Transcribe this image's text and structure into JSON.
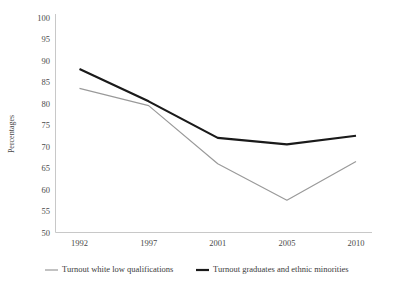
{
  "chart_data": {
    "type": "line",
    "title": "",
    "xlabel": "",
    "ylabel": "Percentages",
    "categories": [
      "1992",
      "1997",
      "2001",
      "2005",
      "2010"
    ],
    "ylim": [
      50,
      100
    ],
    "yticks": [
      50,
      55,
      60,
      65,
      70,
      75,
      80,
      85,
      90,
      95,
      100
    ],
    "grid": false,
    "legend_position": "bottom",
    "series": [
      {
        "name": "Turnout white low qualifications",
        "color": "#9a9a9a",
        "width": 1.2,
        "values": [
          83.5,
          79.5,
          66.0,
          57.5,
          66.5
        ]
      },
      {
        "name": "Turnout graduates and ethnic minorities",
        "color": "#1a1a1a",
        "width": 2.2,
        "values": [
          88.0,
          80.5,
          72.0,
          70.5,
          72.5
        ]
      }
    ]
  },
  "legend": {
    "entries": [
      {
        "label": "Turnout white low qualifications"
      },
      {
        "label": "Turnout graduates and ethnic minorities"
      }
    ]
  },
  "axes": {
    "y_axis_label": "Percentages"
  }
}
